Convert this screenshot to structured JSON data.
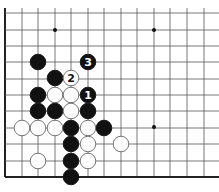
{
  "diagram": {
    "type": "go-board-fragment",
    "grid": {
      "x": [
        5,
        22,
        38,
        55,
        71,
        88,
        104,
        121,
        137,
        154,
        170,
        187,
        204
      ],
      "y": [
        13,
        30,
        46,
        62,
        79,
        95,
        111,
        128,
        144,
        161,
        177
      ],
      "left_edge": true,
      "bottom_edge": true
    },
    "star_points": [
      [
        55,
        30
      ],
      [
        154,
        30
      ],
      [
        154,
        127
      ]
    ],
    "stones": [
      {
        "color": "black",
        "x": 38,
        "y": 62,
        "label": ""
      },
      {
        "color": "black",
        "x": 88,
        "y": 62,
        "label": "3"
      },
      {
        "color": "black",
        "x": 55,
        "y": 78,
        "label": ""
      },
      {
        "color": "white",
        "x": 71,
        "y": 78,
        "label": "2"
      },
      {
        "color": "black",
        "x": 38,
        "y": 95,
        "label": ""
      },
      {
        "color": "white",
        "x": 55,
        "y": 95,
        "label": ""
      },
      {
        "color": "white",
        "x": 71,
        "y": 95,
        "label": ""
      },
      {
        "color": "black",
        "x": 88,
        "y": 95,
        "label": "1"
      },
      {
        "color": "black",
        "x": 38,
        "y": 111,
        "label": ""
      },
      {
        "color": "black",
        "x": 55,
        "y": 111,
        "label": ""
      },
      {
        "color": "white",
        "x": 71,
        "y": 111,
        "label": ""
      },
      {
        "color": "black",
        "x": 88,
        "y": 111,
        "label": ""
      },
      {
        "color": "white",
        "x": 22,
        "y": 128,
        "label": ""
      },
      {
        "color": "white",
        "x": 38,
        "y": 128,
        "label": ""
      },
      {
        "color": "white",
        "x": 55,
        "y": 128,
        "label": ""
      },
      {
        "color": "black",
        "x": 71,
        "y": 128,
        "label": ""
      },
      {
        "color": "white",
        "x": 88,
        "y": 128,
        "label": ""
      },
      {
        "color": "black",
        "x": 104,
        "y": 128,
        "label": ""
      },
      {
        "color": "black",
        "x": 71,
        "y": 144,
        "label": ""
      },
      {
        "color": "white",
        "x": 88,
        "y": 144,
        "label": ""
      },
      {
        "color": "white",
        "x": 121,
        "y": 144,
        "label": ""
      },
      {
        "color": "white",
        "x": 38,
        "y": 161,
        "label": ""
      },
      {
        "color": "black",
        "x": 71,
        "y": 161,
        "label": ""
      },
      {
        "color": "white",
        "x": 88,
        "y": 161,
        "label": ""
      },
      {
        "color": "black",
        "x": 71,
        "y": 177,
        "label": ""
      }
    ],
    "colors": {
      "line": "#555555",
      "edge": "#222222",
      "black": "#111111",
      "white": "#ffffff"
    }
  }
}
